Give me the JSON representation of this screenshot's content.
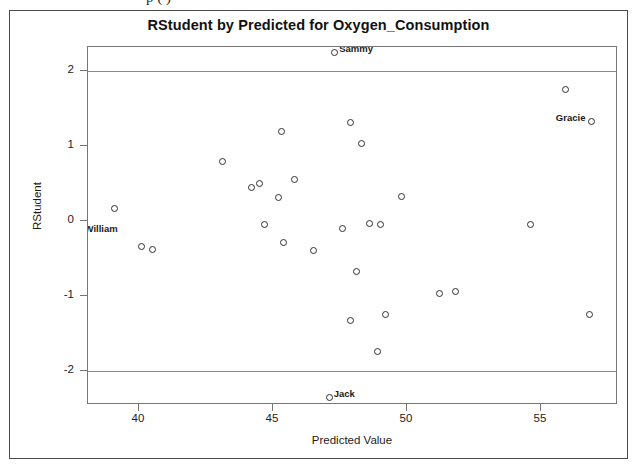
{
  "page": {
    "top_cut_text": "p (   )",
    "background_color": "#ffffff",
    "frame_color": "#4a4a4a"
  },
  "chart_data": {
    "type": "scatter",
    "title": "RStudent by Predicted for Oxygen_Consumption",
    "xlabel": "Predicted Value",
    "ylabel": "RStudent",
    "xlim": [
      36.7,
      57.5
    ],
    "ylim": [
      -2.6,
      2.4
    ],
    "xticks": [
      40,
      45,
      50,
      55
    ],
    "yticks": [
      2,
      1,
      0,
      -1,
      -2
    ],
    "grid": false,
    "legend": null,
    "marker": "open-circle",
    "marker_color": "#2f2f2f",
    "reference_lines": [
      {
        "axis": "y",
        "value": 2,
        "color": "#8a8a8a"
      },
      {
        "axis": "y",
        "value": -2,
        "color": "#8a8a8a"
      }
    ],
    "points": [
      {
        "x": 47.3,
        "y": 2.25,
        "label": "Sammy",
        "label_pos": "right"
      },
      {
        "x": 55.9,
        "y": 1.75,
        "label": null
      },
      {
        "x": 56.9,
        "y": 1.33,
        "label": "Gracie",
        "label_pos": "left"
      },
      {
        "x": 47.9,
        "y": 1.31,
        "label": null
      },
      {
        "x": 45.3,
        "y": 1.19,
        "label": null
      },
      {
        "x": 48.3,
        "y": 1.03,
        "label": null
      },
      {
        "x": 43.1,
        "y": 0.8,
        "label": null
      },
      {
        "x": 45.8,
        "y": 0.55,
        "label": null
      },
      {
        "x": 44.5,
        "y": 0.5,
        "label": null
      },
      {
        "x": 44.2,
        "y": 0.45,
        "label": null
      },
      {
        "x": 49.8,
        "y": 0.33,
        "label": null
      },
      {
        "x": 45.2,
        "y": 0.32,
        "label": null
      },
      {
        "x": 39.1,
        "y": 0.17,
        "label": null
      },
      {
        "x": 44.7,
        "y": -0.05,
        "label": null
      },
      {
        "x": 48.6,
        "y": -0.03,
        "label": null
      },
      {
        "x": 49.0,
        "y": -0.05,
        "label": null
      },
      {
        "x": 54.6,
        "y": -0.04,
        "label": null
      },
      {
        "x": 47.6,
        "y": -0.1,
        "label": null
      },
      {
        "x": 37.8,
        "y": -0.15,
        "label": "William",
        "label_pos": "right"
      },
      {
        "x": 45.4,
        "y": -0.28,
        "label": null
      },
      {
        "x": 40.1,
        "y": -0.34,
        "label": null
      },
      {
        "x": 40.5,
        "y": -0.38,
        "label": null
      },
      {
        "x": 46.5,
        "y": -0.39,
        "label": null
      },
      {
        "x": 48.1,
        "y": -0.67,
        "label": null
      },
      {
        "x": 51.2,
        "y": -0.97,
        "label": null
      },
      {
        "x": 51.8,
        "y": -0.94,
        "label": null
      },
      {
        "x": 49.2,
        "y": -1.25,
        "label": null
      },
      {
        "x": 56.8,
        "y": -1.25,
        "label": null
      },
      {
        "x": 47.9,
        "y": -1.32,
        "label": null
      },
      {
        "x": 48.9,
        "y": -1.74,
        "label": null
      },
      {
        "x": 47.1,
        "y": -2.35,
        "label": "Jack",
        "label_pos": "right"
      }
    ]
  }
}
